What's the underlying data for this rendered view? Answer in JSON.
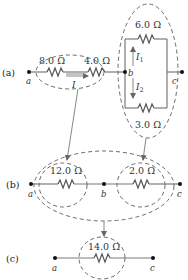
{
  "figure": {
    "panels": [
      {
        "label": "(a)",
        "nodes": [
          "a",
          "b",
          "c"
        ],
        "resistors": [
          {
            "label": "8.0 Ω",
            "ohms": 8.0
          },
          {
            "label": "4.0 Ω",
            "ohms": 4.0
          },
          {
            "label": "6.0 Ω",
            "ohms": 6.0
          },
          {
            "label": "3.0 Ω",
            "ohms": 3.0
          }
        ],
        "currents": {
          "main": "I",
          "branch1": "I",
          "branch1_sub": "1",
          "branch2": "I",
          "branch2_sub": "2"
        }
      },
      {
        "label": "(b)",
        "nodes": [
          "a",
          "b",
          "c"
        ],
        "resistors": [
          {
            "label": "12.0 Ω",
            "ohms": 12.0
          },
          {
            "label": "2.0 Ω",
            "ohms": 2.0
          }
        ]
      },
      {
        "label": "(c)",
        "nodes": [
          "a",
          "c"
        ],
        "resistors": [
          {
            "label": "14.0 Ω",
            "ohms": 14.0
          }
        ]
      }
    ],
    "colors": {
      "wire": "#7a7a7a",
      "dashed_outline": "#6a6a6a",
      "text": "#333333"
    }
  }
}
